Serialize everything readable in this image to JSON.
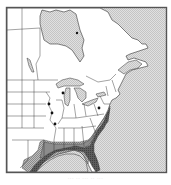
{
  "map": {
    "title": "Range map — eastern North America",
    "region": "Eastern United States and Canada",
    "legend": [
      {
        "key": "range_core",
        "label": "Core range",
        "color": "#5a5a5a"
      },
      {
        "key": "range_outer",
        "label": "Outer range",
        "color": "#9a9a9a"
      },
      {
        "key": "range_hatched",
        "label": "Peripheral range",
        "color": "#b8b8b8"
      },
      {
        "key": "water",
        "label": "Water",
        "color": "#d4d4d4"
      },
      {
        "key": "land",
        "label": "Land",
        "color": "#ffffff"
      }
    ],
    "markers": [
      {
        "name": "record-1",
        "x": 63,
        "y": 93
      },
      {
        "name": "record-2",
        "x": 49,
        "y": 104
      },
      {
        "name": "record-3",
        "x": 52,
        "y": 113
      },
      {
        "name": "record-4",
        "x": 55,
        "y": 124
      },
      {
        "name": "record-5",
        "x": 99,
        "y": 108
      },
      {
        "name": "record-6",
        "x": 77,
        "y": 33
      }
    ],
    "caption": "··· ·· ··· ·· ···"
  },
  "colors": {
    "frame": "#555555",
    "border_lines": "#333333",
    "water": "#d4d4d4",
    "land": "#ffffff",
    "range_dark": "#4a4a4a",
    "range_mid": "#8a8a8a",
    "range_light": "#b0b0b0"
  }
}
